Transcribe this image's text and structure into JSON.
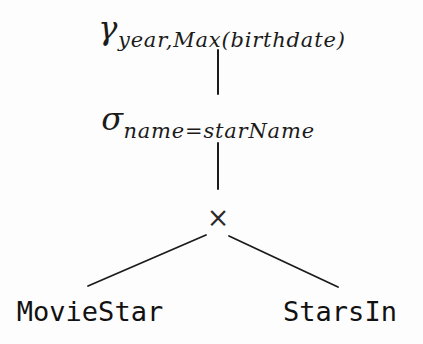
{
  "diagram": {
    "kind": "relational-algebra-query-tree",
    "nodes": {
      "aggregation": {
        "operator": "γ",
        "subscript": "year,Max(birthdate)"
      },
      "selection": {
        "operator": "σ",
        "subscript": "name=starName"
      },
      "product": {
        "operator": "×"
      },
      "left_leaf": {
        "label": "MovieStar"
      },
      "right_leaf": {
        "label": "StarsIn"
      }
    },
    "colors": {
      "ink": "#1b1b1b",
      "background": "#fdfdfd"
    }
  }
}
